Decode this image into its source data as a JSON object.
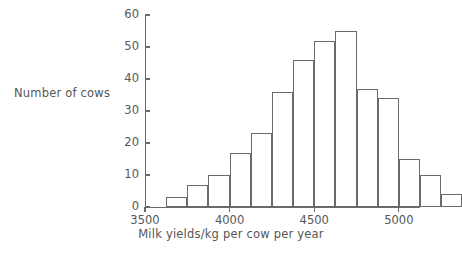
{
  "chart_data": {
    "type": "bar",
    "title": "",
    "xlabel": "Milk yields/kg per cow per year",
    "ylabel": "Number of cows",
    "grid": false,
    "legend": false,
    "xlim": [
      3500,
      5125
    ],
    "ylim": [
      0,
      60
    ],
    "bin_width": 125,
    "x_ticks": [
      3500,
      4000,
      4500,
      5000
    ],
    "x_tick_labels": [
      "3500",
      "4000",
      "4500",
      "5000"
    ],
    "y_ticks": [
      0,
      10,
      20,
      30,
      40,
      50,
      60
    ],
    "y_tick_labels": [
      "0",
      "10",
      "20",
      "30",
      "40",
      "50",
      "60"
    ],
    "bins": [
      {
        "start": 3625,
        "end": 3750,
        "value": 3
      },
      {
        "start": 3750,
        "end": 3875,
        "value": 7
      },
      {
        "start": 3875,
        "end": 4000,
        "value": 10
      },
      {
        "start": 4000,
        "end": 4125,
        "value": 17
      },
      {
        "start": 4125,
        "end": 4250,
        "value": 23
      },
      {
        "start": 4250,
        "end": 4375,
        "value": 36
      },
      {
        "start": 4375,
        "end": 4500,
        "value": 46
      },
      {
        "start": 4500,
        "end": 4625,
        "value": 52
      },
      {
        "start": 4625,
        "end": 4750,
        "value": 55
      },
      {
        "start": 4750,
        "end": 4875,
        "value": 37
      },
      {
        "start": 4875,
        "end": 5000,
        "value": 34
      },
      {
        "start": 5000,
        "end": 5125,
        "value": 15
      },
      {
        "start": 5125,
        "end": 5250,
        "value": 10
      },
      {
        "start": 5250,
        "end": 5375,
        "value": 4
      }
    ],
    "categories": [
      "3625-3750",
      "3750-3875",
      "3875-4000",
      "4000-4125",
      "4125-4250",
      "4250-4375",
      "4375-4500",
      "4500-4625",
      "4625-4750",
      "4750-4875",
      "4875-5000",
      "5000-5125",
      "5125-5250",
      "5250-5375"
    ],
    "values": [
      3,
      7,
      10,
      17,
      23,
      36,
      46,
      52,
      55,
      37,
      34,
      15,
      10,
      4
    ],
    "colors": {
      "bar_stroke": "#6b6b6b",
      "bar_fill": "#ffffff",
      "axis": "#6b6b6b",
      "text": "#565656",
      "background": "#ffffff"
    }
  }
}
